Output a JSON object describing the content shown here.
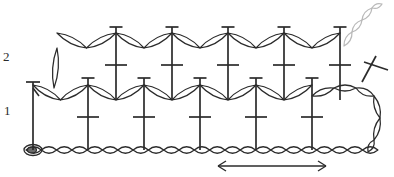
{
  "diagram": {
    "kind": "crochet-stitch-chart",
    "title": "",
    "width": 394,
    "height": 177,
    "background_color": "#ffffff",
    "ink_color": "#2b2b2b",
    "faint_ink_color": "#b9b9b9"
  },
  "labels": {
    "row2": "2",
    "row1": "1",
    "row2_position": {
      "x": 3,
      "y": 50
    },
    "row1_position": {
      "x": 4,
      "y": 104
    }
  },
  "foundation": {
    "name": "foundation-chain",
    "y": 150,
    "x_start": 26,
    "x_end": 378,
    "stitch_count": 23,
    "link_width": 15.3,
    "link_height": 13,
    "slip_knot": {
      "x": 33,
      "y": 150,
      "rx": 9,
      "ry": 5.5
    }
  },
  "repeat_arrow": {
    "name": "pattern-repeat-arrow",
    "y": 166,
    "x_start": 218,
    "x_end": 326,
    "head_length": 8,
    "head_spread": 5
  },
  "row1": {
    "label": "1",
    "post_top_y": 78,
    "post_bottom_y": 150,
    "crossbar_y": 117,
    "crossbar_half_width": 11,
    "turning_chain_x": 33,
    "posts_x": [
      88,
      144,
      200,
      256,
      312
    ],
    "chain_arcs": [
      {
        "from_x": 33,
        "to_x": 88,
        "dip_y": 100,
        "top_y": 85,
        "links": 2
      },
      {
        "from_x": 88,
        "to_x": 144,
        "dip_y": 100,
        "top_y": 85,
        "links": 2
      },
      {
        "from_x": 144,
        "to_x": 200,
        "dip_y": 100,
        "top_y": 85,
        "links": 2
      },
      {
        "from_x": 200,
        "to_x": 256,
        "dip_y": 100,
        "top_y": 85,
        "links": 2
      },
      {
        "from_x": 256,
        "to_x": 312,
        "dip_y": 100,
        "top_y": 85,
        "links": 2
      }
    ],
    "end_turning_chain": {
      "from_x": 312,
      "to_x": 374,
      "apex_y": 96
    }
  },
  "row2": {
    "label": "2",
    "post_top_y": 27,
    "post_bottom_y": 100,
    "crossbar_y": 65,
    "crossbar_half_width": 11,
    "turning_chain_x": 57,
    "posts_x": [
      116,
      172,
      228,
      284,
      340
    ],
    "chain_arcs": [
      {
        "from_x": 57,
        "to_x": 116,
        "dip_y": 48,
        "top_y": 33,
        "links": 2
      },
      {
        "from_x": 116,
        "to_x": 172,
        "dip_y": 48,
        "top_y": 33,
        "links": 2
      },
      {
        "from_x": 172,
        "to_x": 228,
        "dip_y": 48,
        "top_y": 33,
        "links": 2
      },
      {
        "from_x": 228,
        "to_x": 284,
        "dip_y": 48,
        "top_y": 33,
        "links": 2
      },
      {
        "from_x": 284,
        "to_x": 340,
        "dip_y": 48,
        "top_y": 33,
        "links": 2
      }
    ],
    "start_turning_chain": {
      "x": 57,
      "y_top": 48,
      "y_bottom": 88
    },
    "end_faint_chain": {
      "from_x": 344,
      "to_x": 380,
      "from_y": 44,
      "to_y": 6,
      "links": 3
    }
  },
  "legend": {
    "chain_stitch": "chain",
    "double_crochet": "double-crochet-post",
    "cross_symbol": "single-crochet-cross",
    "repeat_marker": "pattern repeat"
  }
}
